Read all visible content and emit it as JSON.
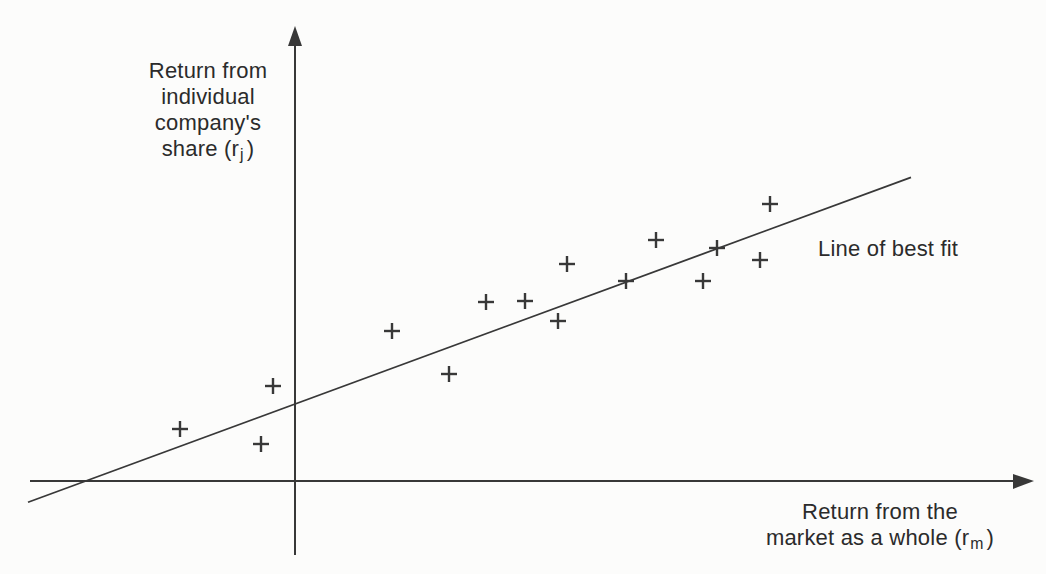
{
  "figure": {
    "background_color": "#fcfcfb",
    "ink_color": "#383838",
    "y_axis_label": {
      "line1": "Return from",
      "line2": "individual",
      "line3": "company's",
      "line4_pre": "share (r",
      "line4_sub": "j",
      "line4_post": ")"
    },
    "x_axis_label": {
      "line1": "Return from the",
      "line2_pre": "market as a whole (r",
      "line2_sub": "m",
      "line2_post": ")"
    },
    "best_fit_label": "Line of best fit"
  },
  "chart_data": {
    "type": "scatter",
    "title": "",
    "xlabel": "Return from the market as a whole (r_m)",
    "ylabel": "Return from individual company's share (r_j)",
    "marker": "+",
    "grid": false,
    "axes_note": "No tick marks or numeric scale shown; both axes unlabeled numerically. Units below are arbitrary (pixels relative to the axis origin). X-axis extends left of the y-axis; points exist in both quadrants.",
    "points": [
      [
        -115,
        52
      ],
      [
        -34,
        37
      ],
      [
        -22,
        95
      ],
      [
        97,
        150
      ],
      [
        154,
        107
      ],
      [
        191,
        179
      ],
      [
        230,
        180
      ],
      [
        263,
        160
      ],
      [
        272,
        217
      ],
      [
        331,
        200
      ],
      [
        361,
        241
      ],
      [
        408,
        200
      ],
      [
        422,
        233
      ],
      [
        465,
        221
      ],
      [
        475,
        277
      ]
    ],
    "best_fit_line": {
      "label": "Line of best fit",
      "slope": 0.368,
      "intercept": 77,
      "x_start": -267,
      "x_end": 616
    }
  }
}
